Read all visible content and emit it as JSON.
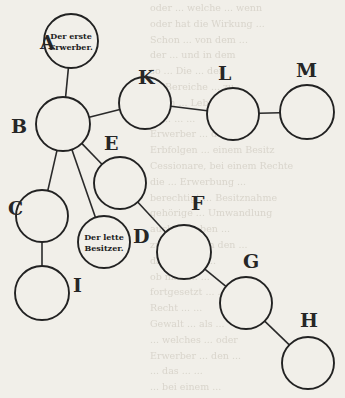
{
  "diagram": {
    "title": "",
    "nodes": [
      {
        "id": "A",
        "label": "A",
        "cx": 71,
        "cy": 41,
        "r": 27,
        "text": [
          "Der erste",
          "Erwerber."
        ],
        "label_x": 40,
        "label_y": 49
      },
      {
        "id": "B",
        "label": "B",
        "cx": 63,
        "cy": 124,
        "r": 27,
        "text": [],
        "label_x": 11,
        "label_y": 133
      },
      {
        "id": "K",
        "label": "K",
        "cx": 145,
        "cy": 103,
        "r": 26,
        "text": [],
        "label_x": 138,
        "label_y": 84
      },
      {
        "id": "L",
        "label": "L",
        "cx": 233,
        "cy": 114,
        "r": 26,
        "text": [],
        "label_x": 218,
        "label_y": 80
      },
      {
        "id": "M",
        "label": "M",
        "cx": 307,
        "cy": 112,
        "r": 27,
        "text": [],
        "label_x": 296,
        "label_y": 77
      },
      {
        "id": "E",
        "label": "E",
        "cx": 120,
        "cy": 183,
        "r": 26,
        "text": [],
        "label_x": 104,
        "label_y": 150
      },
      {
        "id": "C",
        "label": "C",
        "cx": 42,
        "cy": 216,
        "r": 26,
        "text": [],
        "label_x": 8,
        "label_y": 215
      },
      {
        "id": "D",
        "label": "D",
        "cx": 104,
        "cy": 242,
        "r": 26,
        "text": [
          "Der lette",
          "Besitzer."
        ],
        "label_x": 133,
        "label_y": 243
      },
      {
        "id": "F",
        "label": "F",
        "cx": 184,
        "cy": 252,
        "r": 27,
        "text": [],
        "label_x": 191,
        "label_y": 210
      },
      {
        "id": "I",
        "label": "I",
        "cx": 42,
        "cy": 293,
        "r": 27,
        "text": [],
        "label_x": 73,
        "label_y": 292
      },
      {
        "id": "G",
        "label": "G",
        "cx": 246,
        "cy": 303,
        "r": 26,
        "text": [],
        "label_x": 243,
        "label_y": 268
      },
      {
        "id": "H",
        "label": "H",
        "cx": 308,
        "cy": 363,
        "r": 26,
        "text": [],
        "label_x": 300,
        "label_y": 327
      }
    ],
    "edges": [
      [
        "A",
        "B"
      ],
      [
        "B",
        "K"
      ],
      [
        "K",
        "L"
      ],
      [
        "L",
        "M"
      ],
      [
        "B",
        "C"
      ],
      [
        "B",
        "D"
      ],
      [
        "B",
        "E"
      ],
      [
        "C",
        "I"
      ],
      [
        "E",
        "F"
      ],
      [
        "F",
        "G"
      ],
      [
        "G",
        "H"
      ]
    ],
    "annotations": {
      "first_acquirer": "Der erste Erwerber.",
      "last_possessor": "Der lette Besitzer."
    }
  },
  "background_text_lines": [
    "oder ... welche ... wenn",
    "oder hat die Wirkung ...",
    "Schon ... von dem ...",
    "der ... und in dem",
    "so ... Die ... der",
    "im Bereiche ... zu",
    "Nach ... Lebens ...",
    "... ... ... ...",
    "Erwerber ... des",
    "Erbfolgen ... einem Besitz",
    "Cessionare, bei einem Rechte",
    "die ... Erwerbung ...",
    "berechtigt ... Besitznahme",
    "gehörige ... Umwandlung",
    "auch ... haben ...",
    "zugleich ... in den ...",
    "dahin ... ob ...",
    "ob man ... ...",
    "fortgesetzt ... ...",
    "Recht ... ...",
    "Gewalt ... als ...",
    "... welches ... oder",
    "Erwerber ... den ...",
    "... das ... ...",
    "... bei einem ..."
  ]
}
